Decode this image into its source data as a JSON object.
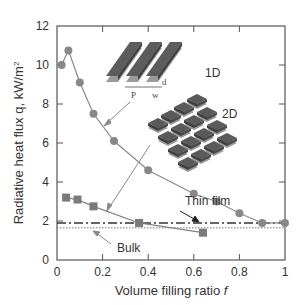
{
  "chart_data": {
    "type": "line",
    "title": "",
    "xlabel": "Volume filling ratio f",
    "ylabel": "Radiative heat flux q, kW/m²",
    "xlim": [
      0,
      1
    ],
    "ylim": [
      0,
      12
    ],
    "xticks": [
      "0",
      "0.2",
      "0.4",
      "0.6",
      "0.8",
      "1"
    ],
    "yticks": [
      "0",
      "2",
      "4",
      "6",
      "8",
      "10",
      "12"
    ],
    "grid": false,
    "legend": "none (inline annotations)",
    "series": [
      {
        "name": "1D",
        "marker": "circle",
        "color": "#8a8a8a",
        "x": [
          0.02,
          0.05,
          0.1,
          0.16,
          0.25,
          0.4,
          0.6,
          0.7,
          0.8,
          0.9,
          1.0
        ],
        "y": [
          10.0,
          10.75,
          9.1,
          7.5,
          6.1,
          4.6,
          3.4,
          3.0,
          2.4,
          1.9,
          1.9
        ]
      },
      {
        "name": "2D",
        "marker": "square",
        "color": "#808080",
        "x": [
          0.04,
          0.09,
          0.16,
          0.36,
          0.64
        ],
        "y": [
          3.2,
          3.1,
          2.75,
          1.9,
          1.4
        ]
      },
      {
        "name": "Thin film",
        "style": "dash-dot",
        "color": "#333333",
        "y_constant": 1.9
      },
      {
        "name": "Bulk",
        "style": "dotted",
        "color": "#666666",
        "y_constant": 1.65
      }
    ],
    "annotations": [
      {
        "text": "1D",
        "target": "circle series (1D grating inset)"
      },
      {
        "text": "2D",
        "target": "square series (2D patch array inset)"
      },
      {
        "text": "Thin film",
        "target": "dash-dot line"
      },
      {
        "text": "Bulk",
        "target": "dotted line"
      },
      {
        "text": "P",
        "meaning": "period"
      },
      {
        "text": "w",
        "meaning": "width"
      },
      {
        "text": "d",
        "meaning": "thickness"
      }
    ]
  },
  "labels": {
    "xlabel_main": "Volume filling ratio ",
    "xlabel_var": "f",
    "ylabel": "Radiative heat flux q, kW/m",
    "ylabel_sup": "2",
    "inset_1d": "1D",
    "inset_2d": "2D",
    "thin_film": "Thin film",
    "bulk": "Bulk",
    "P": "P",
    "w": "w",
    "d": "d"
  },
  "ticks": {
    "x": [
      "0",
      "0.2",
      "0.4",
      "0.6",
      "0.8",
      "1"
    ],
    "y": [
      "0",
      "2",
      "4",
      "6",
      "8",
      "10",
      "12"
    ]
  }
}
